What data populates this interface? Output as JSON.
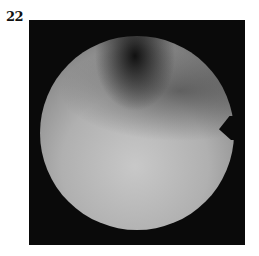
{
  "figure": {
    "label": "22",
    "image": {
      "description": "grayscale circular endoscopic view with dark upper region and notch on right edge",
      "background_color": "#0a0a0a",
      "disc_color": "#b8b8b8"
    }
  }
}
